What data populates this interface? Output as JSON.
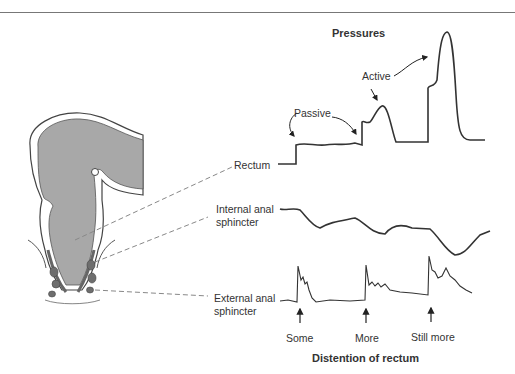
{
  "diagram": {
    "title_top": "Pressures",
    "title_bottom": "Distention of rectum",
    "annotations": {
      "passive": "Passive",
      "active": "Active"
    },
    "traces": [
      {
        "label": "Rectum"
      },
      {
        "label_line1": "Internal anal",
        "label_line2": "sphincter"
      },
      {
        "label_line1": "External anal",
        "label_line2": "sphincter"
      }
    ],
    "stimuli": [
      "Some",
      "More",
      "Still more"
    ],
    "colors": {
      "trace": "#333333",
      "tissue_fill": "#a8a8a8",
      "muscle_fill": "#6e6e6e",
      "dashed_leader": "#888888"
    }
  }
}
